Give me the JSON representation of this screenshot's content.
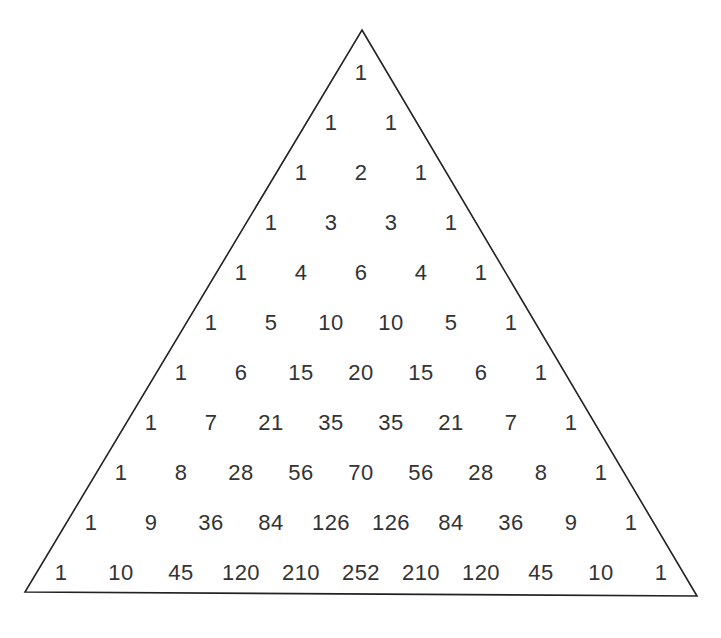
{
  "triangle": {
    "apex": [
      362,
      30
    ],
    "bottom_left": [
      25,
      592
    ],
    "bottom_right": [
      697,
      596
    ],
    "stroke_color": "#222222"
  },
  "layout": {
    "center_x": 361,
    "first_row_y": 73,
    "row_spacing": 50,
    "col_spacing": 60
  },
  "text_color": "#333333",
  "rows": [
    [
      "1"
    ],
    [
      "1",
      "1"
    ],
    [
      "1",
      "2",
      "1"
    ],
    [
      "1",
      "3",
      "3",
      "1"
    ],
    [
      "1",
      "4",
      "6",
      "4",
      "1"
    ],
    [
      "1",
      "5",
      "10",
      "10",
      "5",
      "1"
    ],
    [
      "1",
      "6",
      "15",
      "20",
      "15",
      "6",
      "1"
    ],
    [
      "1",
      "7",
      "21",
      "35",
      "35",
      "21",
      "7",
      "1"
    ],
    [
      "1",
      "8",
      "28",
      "56",
      "70",
      "56",
      "28",
      "8",
      "1"
    ],
    [
      "1",
      "9",
      "36",
      "84",
      "126",
      "126",
      "84",
      "36",
      "9",
      "1"
    ],
    [
      "1",
      "10",
      "45",
      "120",
      "210",
      "252",
      "210",
      "120",
      "45",
      "10",
      "1"
    ]
  ]
}
